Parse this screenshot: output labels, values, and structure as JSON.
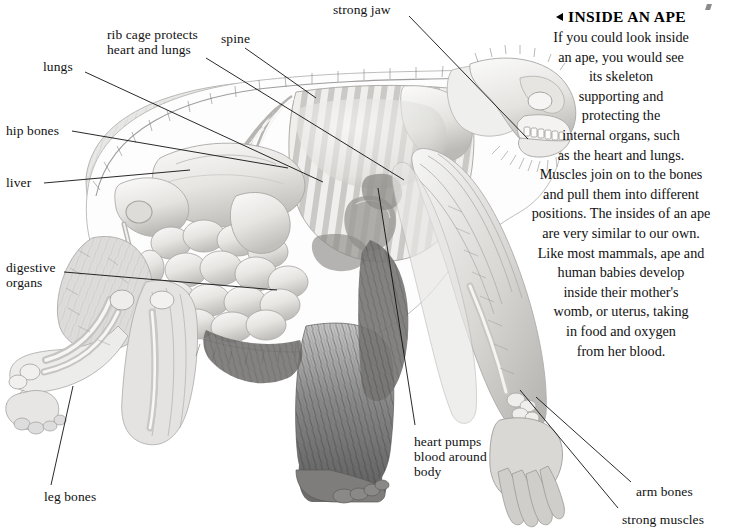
{
  "page": {
    "width": 732,
    "height": 530,
    "background": "#ffffff",
    "ink": "#111111"
  },
  "heading": {
    "marker": "left-triangle",
    "text": "INSIDE AN APE"
  },
  "body_lines": [
    "If you could look inside",
    "an ape, you would see",
    "its skeleton",
    "supporting and",
    "protecting the",
    "internal organs, such",
    "as the heart and lungs.",
    "Muscles join on to the bones",
    "and pull them into different",
    "positions. The insides of an ape",
    "are very similar to our own.",
    "Like most mammals, ape and",
    "human babies develop",
    "inside their mother's",
    "womb, or uterus, taking",
    "in food and oxygen",
    "from her blood."
  ],
  "labels": [
    {
      "id": "strong-jaw",
      "text": "strong jaw",
      "x": 333,
      "y": 2,
      "align": "left"
    },
    {
      "id": "rib-cage",
      "text": "rib cage protects\nheart and lungs",
      "x": 107,
      "y": 27,
      "align": "left"
    },
    {
      "id": "spine",
      "text": "spine",
      "x": 221,
      "y": 31,
      "align": "left"
    },
    {
      "id": "lungs",
      "text": "lungs",
      "x": 43,
      "y": 59,
      "align": "left"
    },
    {
      "id": "hip-bones",
      "text": "hip bones",
      "x": 6,
      "y": 123,
      "align": "left"
    },
    {
      "id": "liver",
      "text": "liver",
      "x": 6,
      "y": 175,
      "align": "left"
    },
    {
      "id": "digestive-organs",
      "text": "digestive\norgans",
      "x": 6,
      "y": 260,
      "align": "left"
    },
    {
      "id": "leg-bones",
      "text": "leg bones",
      "x": 44,
      "y": 489,
      "align": "left"
    },
    {
      "id": "heart-pumps",
      "text": "heart pumps\nblood around\nbody",
      "x": 414,
      "y": 434,
      "align": "left"
    },
    {
      "id": "arm-bones",
      "text": "arm bones",
      "x": 636,
      "y": 484,
      "align": "left"
    },
    {
      "id": "strong-muscles",
      "text": "strong muscles",
      "x": 622,
      "y": 512,
      "align": "left"
    }
  ],
  "leader_lines": [
    {
      "id": "leader-strong-jaw",
      "x1": 409,
      "y1": 16,
      "x2": 528,
      "y2": 139
    },
    {
      "id": "leader-rib-cage",
      "x1": 206,
      "y1": 58,
      "x2": 404,
      "y2": 180
    },
    {
      "id": "leader-spine",
      "x1": 245,
      "y1": 48,
      "x2": 316,
      "y2": 98
    },
    {
      "id": "leader-lungs",
      "x1": 85,
      "y1": 72,
      "x2": 323,
      "y2": 182
    },
    {
      "id": "leader-hip-bones",
      "x1": 72,
      "y1": 131,
      "x2": 288,
      "y2": 168
    },
    {
      "id": "leader-liver",
      "x1": 44,
      "y1": 183,
      "x2": 190,
      "y2": 170
    },
    {
      "id": "leader-digestive-organs",
      "x1": 64,
      "y1": 272,
      "x2": 277,
      "y2": 290
    },
    {
      "id": "leader-leg-bones",
      "x1": 51,
      "y1": 485,
      "x2": 73,
      "y2": 386
    },
    {
      "id": "leader-heart-pumps",
      "x1": 415,
      "y1": 425,
      "x2": 378,
      "y2": 188
    },
    {
      "id": "leader-arm-bones",
      "x1": 631,
      "y1": 482,
      "x2": 536,
      "y2": 397
    },
    {
      "id": "leader-strong-muscles",
      "x1": 618,
      "y1": 508,
      "x2": 520,
      "y2": 390
    }
  ],
  "illustration": {
    "name": "ape-anatomy-cutaway",
    "description": "Side view of an ape on all fours with cutaway showing skeleton, ribcage, lungs, liver, digestive organs and heart",
    "palette": {
      "fur_dark": "#4a4a4a",
      "fur_mid": "#8d8d8d",
      "bone_light": "#f2f1ef",
      "bone_shade": "#c9c7c4",
      "organ_light": "#eeeeec",
      "organ_shade": "#b9b7b4",
      "outline": "#9a9a9a"
    }
  }
}
